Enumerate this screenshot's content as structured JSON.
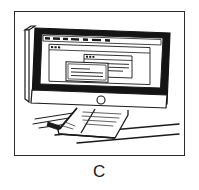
{
  "figure": {
    "panel_label": "C",
    "caption_alt": "Line drawing of a desktop computer monitor on a desk displaying overlapping windows",
    "frame": {
      "x": 14,
      "y": 11,
      "width": 171,
      "height": 145
    }
  },
  "colors": {
    "ink": "#1a1a1a",
    "frame_border": "#2b2b2b",
    "bezel_fill": "#141414",
    "screen_fill": "#ffffff",
    "paper": "#ffffff",
    "hatch": "#3a3a3a"
  },
  "monitor": {
    "name": "desktop-monitor",
    "bezel_style": "thick-black",
    "power_indicator": {
      "name": "power-indicator-circle",
      "shape": "circle",
      "radius": 4
    },
    "stand": {
      "name": "monitor-stand",
      "style": "curved-angled-foot"
    }
  },
  "screen": {
    "menubar": {
      "name": "screen-menubar",
      "items": [
        {
          "label": ""
        },
        {
          "label": ""
        },
        {
          "label": ""
        },
        {
          "label": ""
        },
        {
          "label": ""
        },
        {
          "label": ""
        },
        {
          "label": ""
        }
      ]
    },
    "app_window": {
      "name": "screen-app-window",
      "titlebar_dots": 3,
      "title": ""
    },
    "dialogs": [
      {
        "name": "screen-dialog-back",
        "title": "",
        "titlebar_dots": 3,
        "text_lines": [
          "",
          "",
          ""
        ]
      },
      {
        "name": "screen-dialog-front",
        "title": "",
        "titlebar_dots": 0,
        "text_lines": [
          "",
          "",
          ""
        ]
      }
    ]
  },
  "desk": {
    "name": "desk-surface",
    "edge_lines": 2,
    "shadow_strokes": 3
  }
}
